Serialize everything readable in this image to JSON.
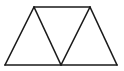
{
  "diagram": {
    "type": "geometry",
    "stroke_color": "#1a1a1a",
    "background": "#ffffff",
    "stroke_width": 1.6,
    "vertices": {
      "A": [
        34,
        7
      ],
      "B": [
        90,
        7
      ],
      "C": [
        5,
        65
      ],
      "D": [
        61,
        65
      ],
      "E": [
        117,
        65
      ]
    },
    "segments": [
      [
        "A",
        "B"
      ],
      [
        "C",
        "E"
      ],
      [
        "A",
        "C"
      ],
      [
        "A",
        "D"
      ],
      [
        "B",
        "D"
      ],
      [
        "B",
        "E"
      ]
    ]
  }
}
